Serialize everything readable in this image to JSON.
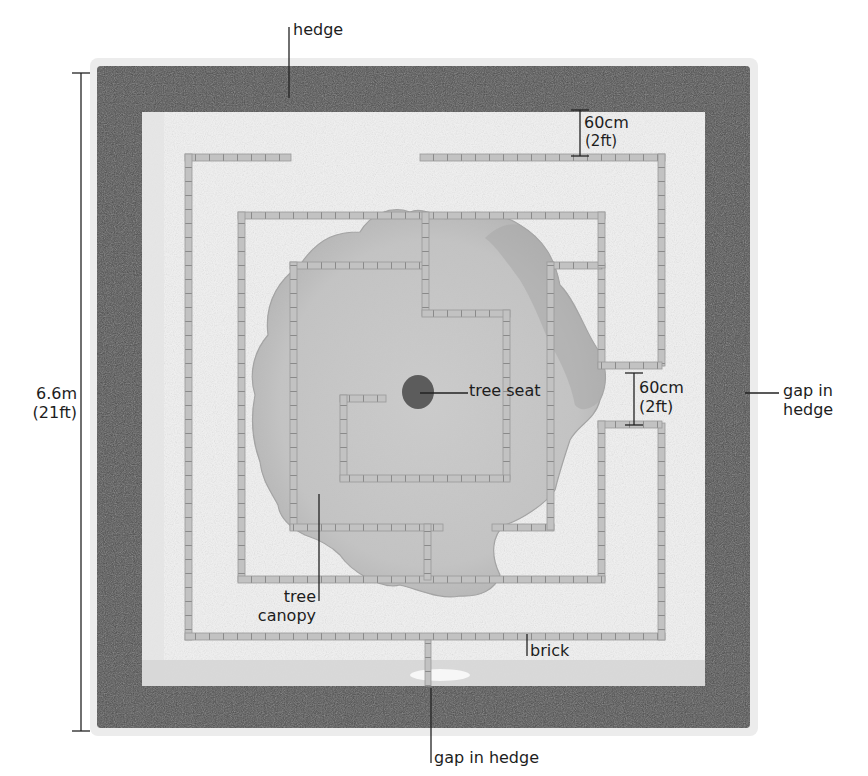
{
  "diagram": {
    "type": "garden-plan",
    "colors": {
      "background": "#ffffff",
      "hedge": "#4a4a4a",
      "hedge_edge": "#3a3a3a",
      "lawn": "#f4f4f4",
      "lawn_shadow": "#dcdcdc",
      "brick": "#b9b9b9",
      "brick_joint": "#8a8a8a",
      "canopy": "#c4c4c4",
      "canopy_edge": "#9a9a9a",
      "tree_seat": "#5a5a5a",
      "leader": "#222222"
    },
    "labels": {
      "hedge": "hedge",
      "spacing_top_line1": "60cm",
      "spacing_top_line2": "(2ft)",
      "dimension_line1": "6.6m",
      "dimension_line2": "(21ft)",
      "tree_seat": "tree seat",
      "spacing_right_line1": "60cm",
      "spacing_right_line2": "(2ft)",
      "gap_right_line1": "gap in",
      "gap_right_line2": "hedge",
      "tree_line1": "tree",
      "tree_line2": "canopy",
      "brick": "brick",
      "gap_bottom": "gap in hedge"
    },
    "dimensions": {
      "overall_side": "6.6m (21ft)",
      "path_width": "60cm (2ft)"
    }
  }
}
